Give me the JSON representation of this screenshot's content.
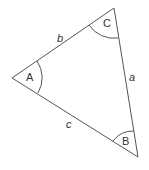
{
  "diagram": {
    "type": "triangle",
    "vertices": [
      {
        "name": "A",
        "label": "A"
      },
      {
        "name": "B",
        "label": "B"
      },
      {
        "name": "C",
        "label": "C"
      }
    ],
    "sides": [
      {
        "name": "a",
        "label": "a",
        "between": "B-C"
      },
      {
        "name": "b",
        "label": "b",
        "between": "A-C"
      },
      {
        "name": "c",
        "label": "c",
        "between": "A-B"
      }
    ],
    "colors": {
      "stroke": "#555555",
      "text": "#333333",
      "background": "#ffffff"
    }
  }
}
